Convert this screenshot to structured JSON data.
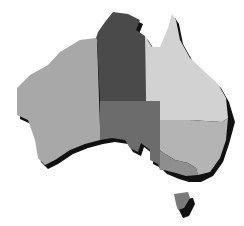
{
  "map": {
    "subject": "Australia",
    "style": "grayscale states with drop shadow",
    "background": "#ffffff",
    "shadow_color": "#111111",
    "regions": [
      {
        "name": "Western Australia",
        "color": "#a8a8a8"
      },
      {
        "name": "Northern Territory",
        "color": "#4a4a4a"
      },
      {
        "name": "South Australia",
        "color": "#6c6c6c"
      },
      {
        "name": "Queensland",
        "color": "#d2d2d2"
      },
      {
        "name": "New South Wales",
        "color": "#b4b4b4"
      },
      {
        "name": "Victoria",
        "color": "#8e8e8e"
      },
      {
        "name": "Tasmania",
        "color": "#7a7a7a"
      }
    ]
  }
}
